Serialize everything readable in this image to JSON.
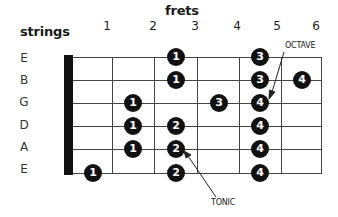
{
  "header": {
    "frets_label": "frets",
    "strings_label": "strings"
  },
  "fret_numbers": [
    "1",
    "2",
    "3",
    "4",
    "5",
    "6"
  ],
  "strings": [
    "E",
    "B",
    "G",
    "D",
    "A",
    "E"
  ],
  "dots": [
    {
      "string": 0,
      "fret": 3,
      "finger": "1"
    },
    {
      "string": 0,
      "fret": 5,
      "finger": "3"
    },
    {
      "string": 1,
      "fret": 3,
      "finger": "1"
    },
    {
      "string": 1,
      "fret": 5,
      "finger": "3"
    },
    {
      "string": 1,
      "fret": 6,
      "finger": "4"
    },
    {
      "string": 2,
      "fret": 2,
      "finger": "1"
    },
    {
      "string": 2,
      "fret": 4,
      "finger": "3"
    },
    {
      "string": 2,
      "fret": 5,
      "finger": "4"
    },
    {
      "string": 3,
      "fret": 2,
      "finger": "1"
    },
    {
      "string": 3,
      "fret": 3,
      "finger": "2"
    },
    {
      "string": 3,
      "fret": 5,
      "finger": "4"
    },
    {
      "string": 4,
      "fret": 2,
      "finger": "1"
    },
    {
      "string": 4,
      "fret": 3,
      "finger": "2"
    },
    {
      "string": 4,
      "fret": 5,
      "finger": "4"
    },
    {
      "string": 5,
      "fret": 1,
      "finger": "1"
    },
    {
      "string": 5,
      "fret": 3,
      "finger": "2"
    },
    {
      "string": 5,
      "fret": 5,
      "finger": "4"
    }
  ],
  "annotations": {
    "octave": "OCTAVE",
    "tonic": "TONIC"
  },
  "colors": {
    "dot": "#111111",
    "dot_text": "#ffffff",
    "grid": "#444444",
    "nut": "#111111"
  }
}
